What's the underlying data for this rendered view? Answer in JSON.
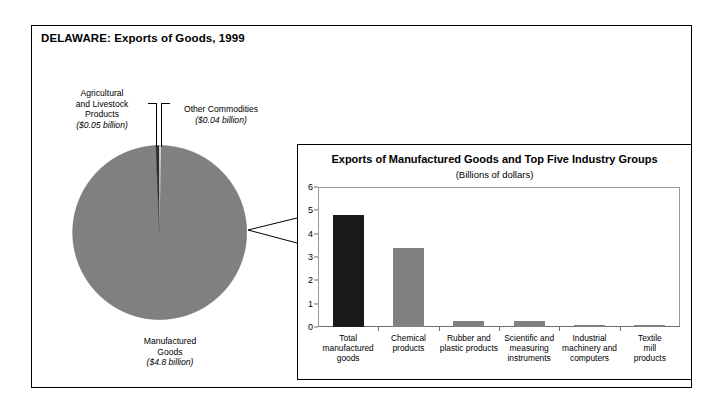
{
  "figure": {
    "title": "DELAWARE: Exports of Goods, 1999"
  },
  "pie": {
    "labels": {
      "agricultural": {
        "name": "Agricultural and Livestock Products",
        "line1": "Agricultural",
        "line2": "and Livestock",
        "line3": "Products",
        "value": "($0.05 billion)"
      },
      "other": {
        "name": "Other Commodities",
        "line1": "Other Commodities",
        "value": "($0.04 billion)"
      },
      "manufactured": {
        "name": "Manufactured Goods",
        "line1": "Manufactured",
        "line2": "Goods",
        "value": "($4.8 billion)"
      }
    }
  },
  "panel": {
    "title": "Exports of Manufactured Goods and Top Five Industry Groups",
    "subtitle": "(Billions of dollars)"
  },
  "colors": {
    "highlight_bar": "#1a1a1a",
    "standard_bar": "#808080",
    "pie_main": "#808080",
    "pie_agricultural": "#2b2b2b",
    "pie_other": "#ffffff",
    "frame": "#000000"
  },
  "chart_data": [
    {
      "type": "pie",
      "title": "DELAWARE: Exports of Goods, 1999",
      "units": "billions of dollars",
      "labels": [
        "Manufactured Goods",
        "Agricultural and Livestock Products",
        "Other Commodities"
      ],
      "values": [
        4.8,
        0.05,
        0.04
      ],
      "value_labels": [
        "($4.8 billion)",
        "($0.05 billion)",
        "($0.04 billion)"
      ],
      "colors": [
        "#808080",
        "#2b2b2b",
        "#ffffff"
      ],
      "legend": "none"
    },
    {
      "type": "bar",
      "title": "Exports of Manufactured Goods and Top Five Industry Groups",
      "subtitle": "(Billions of dollars)",
      "xlabel": "",
      "ylabel": "",
      "categories": [
        "Total manufactured goods",
        "Chemical products",
        "Rubber and plastic products",
        "Scientific and measuring instruments",
        "Industrial machinery and computers",
        "Textile mill products"
      ],
      "category_lines": [
        [
          "Total",
          "manufactured",
          "goods"
        ],
        [
          "Chemical",
          "products"
        ],
        [
          "Rubber and",
          "plastic products"
        ],
        [
          "Scientific and",
          "measuring",
          "instruments"
        ],
        [
          "Industrial",
          "machinery and",
          "computers"
        ],
        [
          "Textile mill",
          "products"
        ]
      ],
      "values": [
        4.8,
        3.4,
        0.26,
        0.27,
        0.1,
        0.08
      ],
      "bar_colors": [
        "#1a1a1a",
        "#808080",
        "#808080",
        "#808080",
        "#808080",
        "#808080"
      ],
      "ylim": [
        0,
        6
      ],
      "yticks": [
        0,
        1,
        2,
        3,
        4,
        5,
        6
      ],
      "ytick_labels": [
        "0",
        "1",
        "2",
        "3",
        "4",
        "5",
        "6"
      ],
      "grid": false,
      "legend": "none"
    }
  ]
}
